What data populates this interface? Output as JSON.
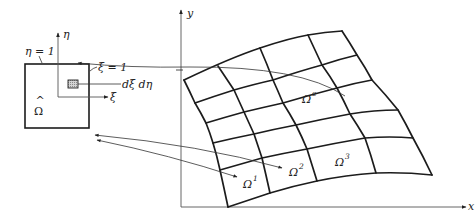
{
  "figure": {
    "master_element": {
      "domain_label": "Ω",
      "domain_hat": "^",
      "eta_edge_label": "η = 1",
      "xi_edge_label": "ξ = 1",
      "differential_label": "dξ dη",
      "xi_axis_label": "ξ",
      "eta_axis_label": "η"
    },
    "physical_domain": {
      "x_axis_label": "x",
      "y_axis_label": "y",
      "elements": [
        {
          "base": "Ω",
          "sup": "e"
        },
        {
          "base": "Ω",
          "sup": "1"
        },
        {
          "base": "Ω",
          "sup": "2"
        },
        {
          "base": "Ω",
          "sup": "3"
        }
      ],
      "mesh": {
        "columns": 4,
        "rows": 5
      }
    },
    "colors": {
      "line": "#1c1c1c",
      "background": "#ffffff",
      "shaded_cell": "#bdbdbd"
    }
  }
}
